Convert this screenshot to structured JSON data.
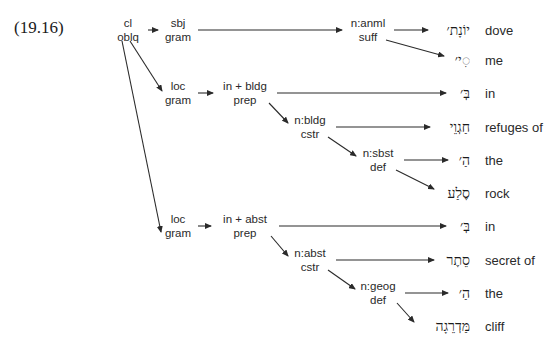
{
  "example_number": "(19.16)",
  "nodes": [
    {
      "id": "root",
      "line1": "cl",
      "line2": "oblq"
    },
    {
      "id": "sbj",
      "line1": "sbj",
      "line2": "gram"
    },
    {
      "id": "anml",
      "line1": "n:anml",
      "line2": "suff"
    },
    {
      "id": "loc1",
      "line1": "loc",
      "line2": "gram"
    },
    {
      "id": "prep1",
      "line1": "in + bldg",
      "line2": "prep"
    },
    {
      "id": "bldg",
      "line1": "n:bldg",
      "line2": "cstr"
    },
    {
      "id": "sbst",
      "line1": "n:sbst",
      "line2": "def"
    },
    {
      "id": "loc2",
      "line1": "loc",
      "line2": "gram"
    },
    {
      "id": "prep2",
      "line1": "in + abst",
      "line2": "prep"
    },
    {
      "id": "abst",
      "line1": "n:abst",
      "line2": "cstr"
    },
    {
      "id": "geog",
      "line1": "n:geog",
      "line2": "def"
    }
  ],
  "leaves": [
    {
      "hebrew": "יוֹנָת׳",
      "gloss": "dove"
    },
    {
      "hebrew": "◌ִי׳",
      "gloss": "me"
    },
    {
      "hebrew": "בְּ׳",
      "gloss": "in"
    },
    {
      "hebrew": "חַגְוֵי",
      "gloss": "refuges of"
    },
    {
      "hebrew": "הַ׳",
      "gloss": "the"
    },
    {
      "hebrew": "סֶלַע",
      "gloss": "rock"
    },
    {
      "hebrew": "בְּ׳",
      "gloss": "in"
    },
    {
      "hebrew": "סֵתֶר",
      "gloss": "secret of"
    },
    {
      "hebrew": "הַ׳",
      "gloss": "the"
    },
    {
      "hebrew": "מַּדְרֵגָה",
      "gloss": "cliff"
    }
  ],
  "edges": [
    [
      "root",
      "sbj"
    ],
    [
      "root",
      "loc1"
    ],
    [
      "root",
      "loc2"
    ],
    [
      "sbj",
      "anml"
    ],
    [
      "anml",
      "leaf0"
    ],
    [
      "anml",
      "leaf1"
    ],
    [
      "loc1",
      "prep1"
    ],
    [
      "prep1",
      "leaf2"
    ],
    [
      "prep1",
      "bldg"
    ],
    [
      "bldg",
      "leaf3"
    ],
    [
      "bldg",
      "sbst"
    ],
    [
      "sbst",
      "leaf4"
    ],
    [
      "sbst",
      "leaf5"
    ],
    [
      "loc2",
      "prep2"
    ],
    [
      "prep2",
      "leaf6"
    ],
    [
      "prep2",
      "abst"
    ],
    [
      "abst",
      "leaf7"
    ],
    [
      "abst",
      "geog"
    ],
    [
      "geog",
      "leaf8"
    ],
    [
      "geog",
      "leaf9"
    ]
  ]
}
